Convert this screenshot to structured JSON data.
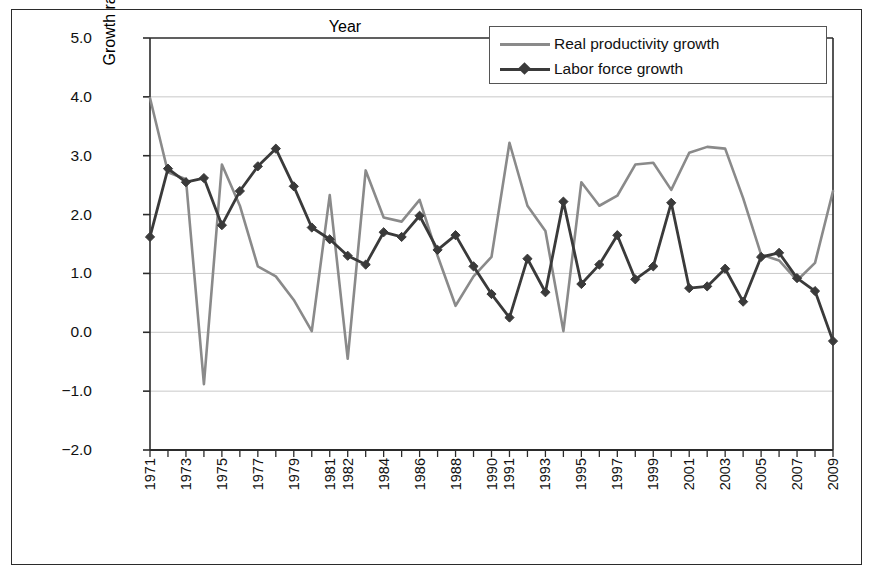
{
  "chart_data": {
    "type": "line",
    "title": "",
    "xlabel": "Year",
    "ylabel": "Growth rate (%)",
    "ylim": [
      -2.0,
      5.0
    ],
    "ytick_labels": [
      "5.0",
      "4.0",
      "3.0",
      "2.0",
      "1.0",
      "0.0",
      "−1.0",
      "−2.0"
    ],
    "ytick_values": [
      5.0,
      4.0,
      3.0,
      2.0,
      1.0,
      0.0,
      -1.0,
      -2.0
    ],
    "grid": "horizontal",
    "legend_position": "top-right",
    "x": [
      1971,
      1972,
      1973,
      1974,
      1975,
      1976,
      1977,
      1978,
      1979,
      1980,
      1981,
      1982,
      1983,
      1984,
      1985,
      1986,
      1987,
      1988,
      1989,
      1990,
      1991,
      1992,
      1993,
      1994,
      1995,
      1996,
      1997,
      1998,
      1999,
      2000,
      2001,
      2002,
      2003,
      2004,
      2005,
      2006,
      2007,
      2008,
      2009
    ],
    "xtick_labels": [
      "1971",
      "1973",
      "1975",
      "1977",
      "1979",
      "1981",
      "1982",
      "1984",
      "1986",
      "1988",
      "1990",
      "1991",
      "1993",
      "1995",
      "1997",
      "1999",
      "2001",
      "2003",
      "2005",
      "2007",
      "2009"
    ],
    "xtick_values": [
      1971,
      1973,
      1975,
      1977,
      1979,
      1981,
      1982,
      1984,
      1986,
      1988,
      1990,
      1991,
      1993,
      1995,
      1997,
      1999,
      2001,
      2003,
      2005,
      2007,
      2009
    ],
    "series": [
      {
        "name": "Real productivity growth",
        "color": "#8a8a8a",
        "marker": "none",
        "values": [
          3.98,
          2.72,
          2.6,
          -0.88,
          2.85,
          2.15,
          1.12,
          0.95,
          0.55,
          0.02,
          2.33,
          -0.45,
          2.75,
          1.95,
          1.88,
          2.25,
          1.3,
          0.45,
          0.95,
          1.28,
          3.22,
          2.15,
          1.72,
          0.02,
          2.55,
          2.15,
          2.32,
          2.85,
          2.88,
          2.42,
          3.05,
          3.15,
          3.12,
          2.28,
          1.32,
          1.22,
          0.88,
          1.18,
          2.4
        ]
      },
      {
        "name": "Labor force growth",
        "color": "#3a3a3a",
        "marker": "diamond",
        "values": [
          1.62,
          2.78,
          2.55,
          2.62,
          1.82,
          2.4,
          2.82,
          3.12,
          2.48,
          1.78,
          1.58,
          1.3,
          1.15,
          1.7,
          1.62,
          1.98,
          1.4,
          1.65,
          1.12,
          0.65,
          0.25,
          1.25,
          0.68,
          2.22,
          0.82,
          1.15,
          1.65,
          0.9,
          1.12,
          2.2,
          0.75,
          0.78,
          1.08,
          0.52,
          1.28,
          1.35,
          0.92,
          0.7,
          -0.15
        ]
      }
    ]
  },
  "legend": {
    "items": [
      {
        "label": "Real productivity growth"
      },
      {
        "label": "Labor force growth"
      }
    ]
  }
}
